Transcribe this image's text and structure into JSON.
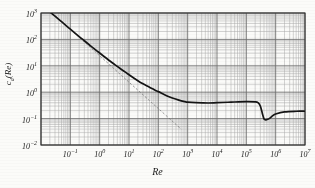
{
  "figure": {
    "background_color": "#fbfbf9",
    "ink_color": "#1a1a1a",
    "grid_major_color": "#6b6b6b",
    "grid_minor_color": "#a8a8a8"
  },
  "axes": {
    "xlabel": "Re",
    "ylabel": "cₙ(Re)",
    "ylabel_display": "c_d(Re)",
    "x_ticks": [
      "10⁻¹",
      "10⁰",
      "10¹",
      "10²",
      "10³",
      "10⁴",
      "10⁵",
      "10⁶",
      "10⁷"
    ],
    "y_ticks": [
      "10³",
      "10²",
      "10¹",
      "10⁰",
      "10⁻¹",
      "10⁻²"
    ],
    "x_tick_mantissas": [
      -1,
      0,
      1,
      2,
      3,
      4,
      5,
      6,
      7
    ],
    "y_tick_mantissas": [
      3,
      2,
      1,
      0,
      -1,
      -2
    ]
  },
  "chart_data": {
    "type": "line",
    "title": "",
    "subtitle": "",
    "xlabel": "Re",
    "ylabel": "c_d(Re)",
    "xscale": "log",
    "yscale": "log",
    "xlim": [
      0.01,
      10000000
    ],
    "ylim": [
      0.01,
      1000
    ],
    "grid": true,
    "grid_minor": true,
    "legend": false,
    "legend_position": "none",
    "annotations": [],
    "series": [
      {
        "name": "drag coefficient of a sphere",
        "style": "solid",
        "linewidth": 1.6,
        "color": "#141414",
        "x": [
          0.02,
          0.03,
          0.05,
          0.08,
          0.1,
          0.2,
          0.3,
          0.5,
          0.8,
          1,
          2,
          3,
          5,
          8,
          10,
          20,
          30,
          50,
          80,
          100,
          200,
          300,
          500,
          800,
          1000,
          2000,
          5000,
          10000,
          30000,
          100000,
          200000,
          250000,
          300000,
          350000,
          400000,
          450000,
          500000,
          600000,
          800000,
          1000000,
          2000000,
          5000000,
          10000000
        ],
        "y": [
          1100,
          760,
          470,
          300,
          245,
          128,
          89,
          56,
          37,
          30.5,
          16.6,
          11.9,
          7.9,
          5.5,
          4.6,
          2.72,
          2.07,
          1.55,
          1.17,
          1.05,
          0.72,
          0.6,
          0.5,
          0.44,
          0.42,
          0.4,
          0.39,
          0.4,
          0.42,
          0.44,
          0.43,
          0.4,
          0.3,
          0.16,
          0.098,
          0.09,
          0.092,
          0.1,
          0.13,
          0.15,
          0.18,
          0.19,
          0.19
        ]
      },
      {
        "name": "Stokes law asymptote 24/Re",
        "style": "dashed",
        "linewidth": 0.7,
        "color": "#6e6e6e",
        "x": [
          0.02,
          0.05,
          0.1,
          0.5,
          1,
          5,
          10,
          50,
          100,
          300,
          600
        ],
        "y": [
          1200,
          480,
          240,
          48,
          24,
          4.8,
          2.4,
          0.48,
          0.24,
          0.08,
          0.04
        ]
      }
    ]
  }
}
